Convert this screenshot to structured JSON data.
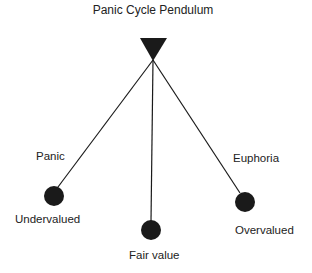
{
  "diagram": {
    "title": "Panic Cycle Pendulum",
    "pivot": {
      "shape": "inverted-triangle",
      "x": 153,
      "y": 60
    },
    "positions": [
      {
        "id": "left",
        "state_label": "Panic",
        "value_label": "Undervalued",
        "bob_x": 54,
        "bob_y": 195
      },
      {
        "id": "center",
        "state_label": "",
        "value_label": "Fair value",
        "bob_x": 151,
        "bob_y": 230
      },
      {
        "id": "right",
        "state_label": "Euphoria",
        "value_label": "Overvalued",
        "bob_x": 245,
        "bob_y": 202
      }
    ],
    "colors": {
      "ink": "#1a1a1a",
      "background": "#ffffff"
    }
  }
}
